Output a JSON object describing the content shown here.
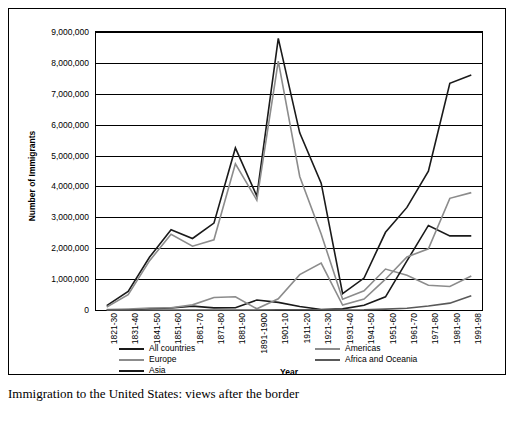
{
  "caption": "Immigration to the United States: views after the border",
  "chart_data": {
    "type": "line",
    "title": "",
    "xlabel": "Year",
    "ylabel": "Number of Immigrants",
    "ylim": [
      0,
      9000000
    ],
    "ytick_values": [
      0,
      1000000,
      2000000,
      3000000,
      4000000,
      5000000,
      6000000,
      7000000,
      8000000,
      9000000
    ],
    "ytick_labels": [
      "0",
      "1,000,000",
      "2,000,000",
      "3,000,000",
      "4,000,000",
      "5,000,000",
      "6,000,000",
      "7,000,000",
      "8,000,000",
      "9,000,000"
    ],
    "grid": true,
    "legend_position": "bottom",
    "categories": [
      "1821-30",
      "1831-40",
      "1841-50",
      "1851-60",
      "1861-70",
      "1871-80",
      "1881-90",
      "1891-1900",
      "1901-10",
      "1911-20",
      "1921-30",
      "1931-40",
      "1941-50",
      "1951-60",
      "1961-70",
      "1971-80",
      "1981-90",
      "1991-98"
    ],
    "series": [
      {
        "name": "All countries",
        "color": "#1a1a1a",
        "values": [
          143439,
          599125,
          1713251,
          2598214,
          2314824,
          2812191,
          5246613,
          3687564,
          8795386,
          5735811,
          4107209,
          528431,
          1035039,
          2515479,
          3321677,
          4493314,
          7338062,
          7605068
        ]
      },
      {
        "name": "Europe",
        "color": "#8c8c8c",
        "values": [
          98797,
          495681,
          1597442,
          2452577,
          2065141,
          2271925,
          4735484,
          3555352,
          8056040,
          4321887,
          2463194,
          347566,
          621147,
          1325727,
          1123492,
          800368,
          761550,
          1100000
        ]
      },
      {
        "name": "Asia",
        "color": "#1a1a1a",
        "values": [
          55,
          141,
          41538,
          64759,
          124160,
          69942,
          74862,
          323543,
          247236,
          112059,
          16595,
          37028,
          153249,
          427642,
          1588178,
          2738157,
          2400000,
          2400000
        ]
      },
      {
        "name": "Americas",
        "color": "#8c8c8c",
        "values": [
          11564,
          33424,
          62469,
          74720,
          166607,
          404044,
          426967,
          38972,
          361888,
          1143671,
          1516716,
          160037,
          354804,
          996944,
          1716374,
          1982735,
          3615225,
          3800000
        ]
      },
      {
        "name": "Africa and Oceania",
        "color": "#595959",
        "values": [
          33,
          69,
          53,
          210,
          312,
          358,
          857,
          350,
          7368,
          8443,
          6286,
          2120,
          7367,
          28954,
          57109,
          130000,
          222000,
          460000
        ]
      }
    ]
  }
}
